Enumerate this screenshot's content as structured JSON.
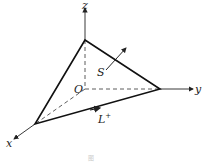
{
  "diagram": {
    "axes": {
      "x": "x",
      "y": "y",
      "z": "z",
      "origin": "O"
    },
    "surface_label": "S",
    "curve_label": "L",
    "curve_superscript": "+",
    "caption": "图"
  }
}
